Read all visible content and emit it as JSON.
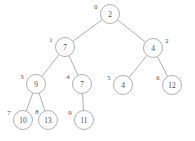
{
  "figure": {
    "background_color": "#ffffff",
    "stroke_color": "#9a9a9a",
    "text_color": "#4a4a4a",
    "node_radius": 9.5
  },
  "chart_data": {
    "type": "diagram",
    "subtype": "binary-tree",
    "title": "",
    "node_count": 10,
    "nodes": [
      {
        "index": "0",
        "value": "2",
        "x": 110,
        "y": 14,
        "index_x": 96,
        "index_y": 6,
        "parent": null,
        "side": "root"
      },
      {
        "index": "1",
        "value": "7",
        "x": 65,
        "y": 47,
        "index_x": 51,
        "index_y": 39,
        "parent": "0",
        "side": "left"
      },
      {
        "index": "2",
        "value": "4",
        "x": 153,
        "y": 48,
        "index_x": 167,
        "index_y": 40,
        "parent": "0",
        "side": "right"
      },
      {
        "index": "3",
        "value": "9",
        "x": 36,
        "y": 84,
        "index_x": 22,
        "index_y": 76,
        "parent": "1",
        "side": "left"
      },
      {
        "index": "4",
        "value": "7",
        "x": 82,
        "y": 84,
        "index_x": 68,
        "index_y": 76,
        "parent": "1",
        "side": "right"
      },
      {
        "index": "5",
        "value": "4",
        "x": 123,
        "y": 85,
        "index_x": 109,
        "index_y": 77,
        "parent": "2",
        "side": "left"
      },
      {
        "index": "6",
        "value": "12",
        "x": 172,
        "y": 85,
        "index_x": 158,
        "index_y": 77,
        "parent": "2",
        "side": "right"
      },
      {
        "index": "7",
        "value": "10",
        "x": 23,
        "y": 120,
        "index_x": 9,
        "index_y": 112,
        "parent": "3",
        "side": "left"
      },
      {
        "index": "8",
        "value": "13",
        "x": 48,
        "y": 120,
        "index_x": 37,
        "index_y": 111,
        "parent": "3",
        "side": "right"
      },
      {
        "index": "9",
        "value": "11",
        "x": 84,
        "y": 120,
        "index_x": 70,
        "index_y": 112,
        "parent": "4",
        "side": "left"
      }
    ],
    "edges": [
      {
        "from": "0",
        "to": "1"
      },
      {
        "from": "0",
        "to": "2"
      },
      {
        "from": "1",
        "to": "3"
      },
      {
        "from": "1",
        "to": "4"
      },
      {
        "from": "2",
        "to": "5"
      },
      {
        "from": "2",
        "to": "6"
      },
      {
        "from": "3",
        "to": "7"
      },
      {
        "from": "3",
        "to": "8"
      },
      {
        "from": "4",
        "to": "9"
      }
    ]
  }
}
